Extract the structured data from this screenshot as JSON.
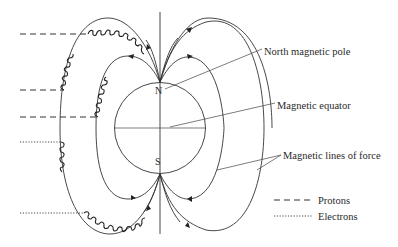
{
  "diagram": {
    "poles": {
      "north": "N",
      "south": "S"
    },
    "labels": {
      "north_pole": "North magnetic pole",
      "equator": "Magnetic equator",
      "lines_of_force": "Magnetic lines of force"
    },
    "legend": {
      "items": [
        {
          "label": "Protons",
          "style": "dashed"
        },
        {
          "label": "Electrons",
          "style": "dotted"
        }
      ]
    },
    "particle_tracks": {
      "protons": 3,
      "electrons": 2
    },
    "colors": {
      "line": "#333333",
      "background": "#ffffff"
    }
  }
}
